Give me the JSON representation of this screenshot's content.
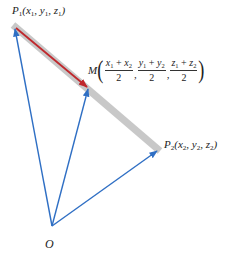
{
  "diagram": {
    "type": "vector-midpoint",
    "colors": {
      "segment_band": "#c8c8c8",
      "half_arrow": "#c0282d",
      "position_vectors": "#2f6fc4",
      "text": "#222222"
    },
    "points": {
      "P1": {
        "x": 15,
        "y": 27
      },
      "M": {
        "x": 88,
        "y": 87
      },
      "P2": {
        "x": 158,
        "y": 150
      },
      "O": {
        "x": 52,
        "y": 226
      }
    },
    "labels": {
      "p1": {
        "name": "P",
        "sub": "1",
        "coords": "(x",
        "c1sub": "1",
        "sep1": ", y",
        "c2sub": "1",
        "sep2": ", z",
        "c3sub": "1",
        "close": ")"
      },
      "p2": {
        "name": "P",
        "sub": "2",
        "coords": "(x",
        "c1sub": "2",
        "sep1": ", y",
        "c2sub": "2",
        "sep2": ", z",
        "c3sub": "2",
        "close": ")"
      },
      "o": "O",
      "m": {
        "name": "M",
        "open": "(",
        "close": ")",
        "fractions": [
          {
            "a": "x",
            "asub": "1",
            "op": " + ",
            "b": "x",
            "bsub": "2",
            "den": "2"
          },
          {
            "a": "y",
            "asub": "1",
            "op": " + ",
            "b": "y",
            "bsub": "2",
            "den": "2"
          },
          {
            "a": "z",
            "asub": "1",
            "op": " + ",
            "b": "z",
            "bsub": "2",
            "den": "2"
          }
        ],
        "comma": ","
      }
    }
  }
}
